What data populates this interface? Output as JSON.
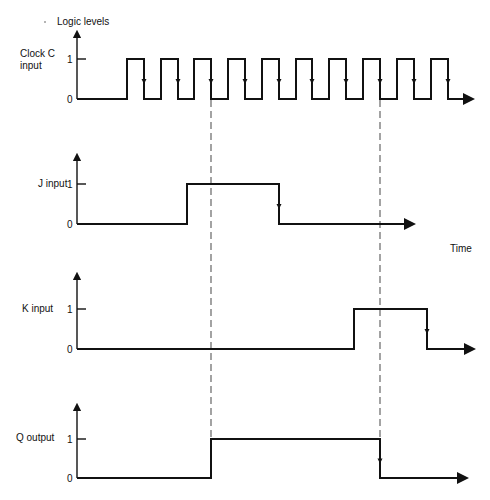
{
  "title": "Logic levels",
  "time_label": "Time",
  "ticks": {
    "high": "1",
    "low": "0"
  },
  "signals": [
    {
      "id": "clock",
      "label_line1": "Clock C",
      "label_line2": "input",
      "axis_top": 30,
      "y_high": 59,
      "y_low": 99,
      "x_end": 473,
      "transitions": [
        127,
        144,
        161,
        178,
        194,
        211,
        228,
        245,
        262,
        279,
        296,
        312,
        329,
        346,
        363,
        380,
        397,
        414,
        431,
        448
      ],
      "falling_edge_arrows": [
        144,
        178,
        211,
        245,
        279,
        312,
        346,
        380,
        414,
        448
      ]
    },
    {
      "id": "j",
      "label_line1": "J input",
      "label_line2": "",
      "axis_top": 153,
      "y_high": 184,
      "y_low": 224,
      "x_end": 414,
      "transitions": [
        187,
        279
      ],
      "falling_edge_arrows": [
        279
      ]
    },
    {
      "id": "k",
      "label_line1": "K input",
      "label_line2": "",
      "axis_top": 272,
      "y_high": 309,
      "y_low": 349,
      "x_end": 474,
      "transitions": [
        354,
        427
      ],
      "falling_edge_arrows": [
        427
      ]
    },
    {
      "id": "q",
      "label_line1": "Q output",
      "label_line2": "",
      "axis_top": 403,
      "y_high": 439,
      "y_low": 478,
      "x_end": 467,
      "transitions": [
        211,
        380
      ],
      "falling_edge_arrows": [
        380
      ]
    }
  ],
  "sync_lines": [
    {
      "x": 211,
      "y1": 100,
      "y2": 438
    },
    {
      "x": 380,
      "y1": 100,
      "y2": 438
    }
  ],
  "axis_x": 77
}
